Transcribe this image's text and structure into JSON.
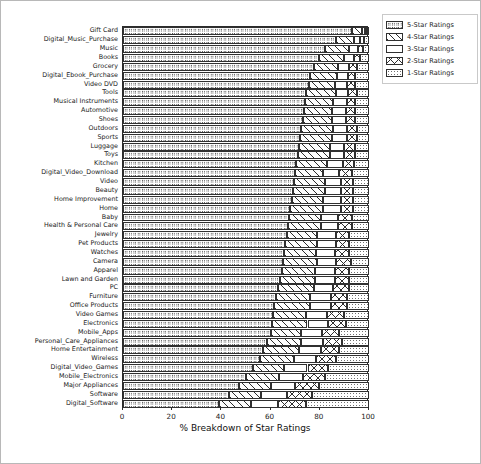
{
  "legend": {
    "position": "upper right",
    "items": [
      {
        "label": "5-Star Ratings",
        "hatch": "o"
      },
      {
        "label": "4-Star Ratings",
        "hatch": "/"
      },
      {
        "label": "3-Star Ratings",
        "hatch": ""
      },
      {
        "label": "2-Star Ratings",
        "hatch": "x"
      },
      {
        "label": "1-Star Ratings",
        "hatch": "."
      }
    ]
  },
  "chart_data": {
    "type": "bar",
    "orientation": "horizontal",
    "stacked": true,
    "title": "",
    "xlabel": "% Breakdown of Star Ratings",
    "ylabel": "",
    "xlim": [
      0,
      100
    ],
    "xticks": [
      0,
      20,
      40,
      60,
      80,
      100
    ],
    "xticklabels": [
      "0",
      "20",
      "40",
      "60",
      "80",
      "100"
    ],
    "grid": false,
    "legend_position": "upper right",
    "categories": [
      "Gift Card",
      "Digital_Music_Purchase",
      "Music",
      "Books",
      "Grocery",
      "Digital_Ebook_Purchase",
      "Video DVD",
      "Tools",
      "Musical Instruments",
      "Automotive",
      "Shoes",
      "Outdoors",
      "Sports",
      "Luggage",
      "Toys",
      "Kitchen",
      "Digital_Video_Download",
      "Video",
      "Beauty",
      "Home Improvement",
      "Home",
      "Baby",
      "Health & Personal Care",
      "Jewelry",
      "Pet Products",
      "Watches",
      "Camera",
      "Apparel",
      "Lawn and Garden",
      "PC",
      "Furniture",
      "Office Products",
      "Video Games",
      "Electronics",
      "Mobile_Apps",
      "Personal_Care_Appliances",
      "Home Entertainment",
      "Wireless",
      "Digital_Video_Games",
      "Mobile_Electronics",
      "Major Appliances",
      "Software",
      "Digital_Software"
    ],
    "series": [
      {
        "name": "5-Star Ratings",
        "hatch": "o",
        "values": [
          93.0,
          86.5,
          82.0,
          79.5,
          77.5,
          76.0,
          75.5,
          74.5,
          74.0,
          73.5,
          73.0,
          72.5,
          72.0,
          71.5,
          71.0,
          70.5,
          70.0,
          69.5,
          69.0,
          68.5,
          68.0,
          67.5,
          67.0,
          66.5,
          66.0,
          65.5,
          65.0,
          64.5,
          64.0,
          63.0,
          62.0,
          61.5,
          61.0,
          60.5,
          60.0,
          58.5,
          57.0,
          55.5,
          53.0,
          50.0,
          47.0,
          43.0,
          39.0
        ]
      },
      {
        "name": "4-Star Ratings",
        "hatch": "/",
        "values": [
          4.0,
          7.5,
          10.0,
          10.5,
          10.0,
          11.0,
          10.5,
          12.0,
          11.5,
          11.5,
          12.0,
          13.0,
          13.0,
          12.5,
          13.0,
          12.5,
          11.5,
          12.5,
          13.0,
          13.0,
          13.5,
          13.0,
          13.5,
          12.5,
          13.0,
          13.0,
          14.0,
          13.5,
          14.0,
          14.5,
          14.0,
          14.5,
          13.5,
          14.5,
          12.5,
          14.0,
          14.5,
          14.0,
          12.5,
          13.5,
          13.0,
          13.0,
          13.0
        ]
      },
      {
        "name": "3-Star Ratings",
        "hatch": "",
        "values": [
          1.2,
          2.5,
          3.5,
          4.0,
          4.5,
          4.5,
          5.0,
          5.0,
          5.5,
          5.5,
          5.5,
          5.5,
          6.0,
          6.0,
          6.0,
          6.5,
          6.5,
          6.5,
          6.5,
          7.0,
          7.0,
          7.0,
          7.0,
          7.5,
          7.5,
          7.5,
          7.5,
          8.0,
          8.0,
          8.0,
          8.5,
          8.5,
          8.5,
          8.5,
          8.5,
          9.0,
          9.0,
          9.0,
          9.5,
          9.5,
          10.0,
          10.5,
          11.0
        ]
      },
      {
        "name": "2-Star Ratings",
        "hatch": "x",
        "values": [
          0.8,
          1.5,
          2.0,
          2.5,
          3.0,
          3.0,
          3.5,
          3.5,
          3.5,
          4.0,
          4.0,
          4.0,
          4.0,
          4.5,
          4.5,
          4.5,
          5.0,
          5.0,
          5.0,
          5.0,
          5.0,
          5.5,
          5.5,
          5.5,
          5.5,
          6.0,
          6.0,
          6.0,
          6.0,
          6.5,
          6.5,
          6.5,
          7.0,
          7.0,
          7.0,
          7.5,
          7.5,
          8.0,
          8.5,
          9.0,
          9.5,
          10.5,
          11.5
        ]
      },
      {
        "name": "1-Star Ratings",
        "hatch": ".",
        "values": [
          1.0,
          2.0,
          2.5,
          3.5,
          5.0,
          5.5,
          5.5,
          5.0,
          5.5,
          5.5,
          5.5,
          5.0,
          5.0,
          5.5,
          5.5,
          6.0,
          7.0,
          6.5,
          6.5,
          6.5,
          6.5,
          7.0,
          7.0,
          8.0,
          8.0,
          8.0,
          7.5,
          8.0,
          8.0,
          8.0,
          9.0,
          9.0,
          10.0,
          9.5,
          12.0,
          11.0,
          12.0,
          13.5,
          16.5,
          18.0,
          20.5,
          23.0,
          25.5
        ]
      }
    ]
  }
}
